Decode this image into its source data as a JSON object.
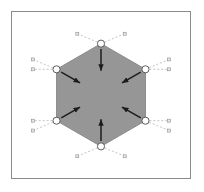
{
  "figure": {
    "frame": {
      "border_color": "#8a8a8a",
      "background": "#ffffff"
    },
    "canvas": {
      "width": 180,
      "height": 168,
      "center_x": 90,
      "center_y": 84
    },
    "polygon": {
      "name": "hexagon",
      "sides": 6,
      "fill_color": "#969696",
      "stroke_color": "#8c8c8c",
      "circumradius": 52,
      "orientation": "pointy-top",
      "vertices": [
        {
          "id": "v-top",
          "x": 90,
          "y": 32
        },
        {
          "id": "v-upper-right",
          "x": 135.0,
          "y": 58
        },
        {
          "id": "v-lower-right",
          "x": 135.0,
          "y": 110
        },
        {
          "id": "v-bottom",
          "x": 90,
          "y": 136
        },
        {
          "id": "v-lower-left",
          "x": 45.0,
          "y": 110
        },
        {
          "id": "v-upper-left",
          "x": 45.0,
          "y": 58
        }
      ]
    },
    "vertex_markers": {
      "shape": "circle",
      "radius": 3.6,
      "stroke_color": "#4a4a4a",
      "fill_color": "#ffffff"
    },
    "arrows": {
      "color": "#1c1c1c",
      "direction": "inward",
      "count": 6,
      "length": 22,
      "items": [
        {
          "id": "arrow-from-top",
          "from_vertex": "v-top",
          "angle_deg": 90
        },
        {
          "id": "arrow-from-upper-right",
          "from_vertex": "v-upper-right",
          "angle_deg": 150
        },
        {
          "id": "arrow-from-lower-right",
          "from_vertex": "v-lower-right",
          "angle_deg": 210
        },
        {
          "id": "arrow-from-bottom",
          "from_vertex": "v-bottom",
          "angle_deg": 270
        },
        {
          "id": "arrow-from-lower-left",
          "from_vertex": "v-lower-left",
          "angle_deg": 330
        },
        {
          "id": "arrow-from-upper-left",
          "from_vertex": "v-upper-left",
          "angle_deg": 30
        }
      ]
    },
    "construction_lines": {
      "style": "dashed",
      "color": "#a8a8a8",
      "dash_pattern": "2 2",
      "count": 12,
      "endpoint_marker": {
        "shape": "square",
        "size": 3,
        "stroke_color": "#8d8d8d",
        "fill_color": "#e8e8e8"
      },
      "items": [
        {
          "id": "line-top-left-up",
          "from_vertex": "v-top",
          "to_x": 66,
          "to_y": 22,
          "label": "a"
        },
        {
          "id": "line-top-right-up",
          "from_vertex": "v-top",
          "to_x": 114,
          "to_y": 22,
          "label": "b"
        },
        {
          "id": "line-upper-left-out",
          "from_vertex": "v-upper-left",
          "to_x": 21,
          "to_y": 48,
          "label": "c"
        },
        {
          "id": "line-upper-left-horiz",
          "from_vertex": "v-upper-left",
          "to_x": 21,
          "to_y": 58,
          "label": "d"
        },
        {
          "id": "line-upper-right-horiz",
          "from_vertex": "v-upper-right",
          "to_x": 159,
          "to_y": 58,
          "label": "e"
        },
        {
          "id": "line-upper-right-out",
          "from_vertex": "v-upper-right",
          "to_x": 159,
          "to_y": 48,
          "label": "f"
        },
        {
          "id": "line-lower-left-out",
          "from_vertex": "v-lower-left",
          "to_x": 21,
          "to_y": 120,
          "label": "g"
        },
        {
          "id": "line-lower-left-horiz",
          "from_vertex": "v-lower-left",
          "to_x": 21,
          "to_y": 110,
          "label": "h"
        },
        {
          "id": "line-lower-right-horiz",
          "from_vertex": "v-lower-right",
          "to_x": 159,
          "to_y": 110,
          "label": "i"
        },
        {
          "id": "line-lower-right-out",
          "from_vertex": "v-lower-right",
          "to_x": 159,
          "to_y": 120,
          "label": "j"
        },
        {
          "id": "line-bottom-left-down",
          "from_vertex": "v-bottom",
          "to_x": 66,
          "to_y": 146,
          "label": "k"
        },
        {
          "id": "line-bottom-right-down",
          "from_vertex": "v-bottom",
          "to_x": 114,
          "to_y": 146,
          "label": "l"
        }
      ]
    }
  }
}
